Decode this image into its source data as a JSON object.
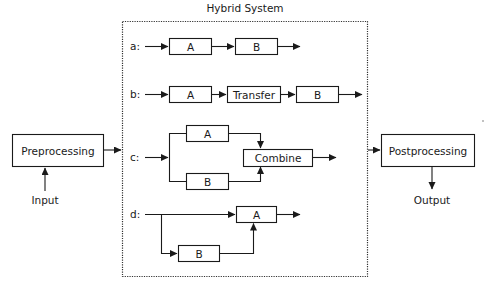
{
  "title": "Hybrid System",
  "preprocessing": {
    "label": "Preprocessing",
    "input_label": "Input"
  },
  "postprocessing": {
    "label": "Postprocessing",
    "output_label": "Output"
  },
  "rows": {
    "a": {
      "label": "a:",
      "boxes": [
        "A",
        "B"
      ]
    },
    "b": {
      "label": "b:",
      "boxes": [
        "A",
        "Transfer",
        "B"
      ]
    },
    "c": {
      "label": "c:",
      "boxes": [
        "A",
        "B",
        "Combine"
      ]
    },
    "d": {
      "label": "d:",
      "boxes": [
        "A",
        "B"
      ]
    }
  },
  "colors": {
    "stroke": "#1a1a1a",
    "background": "#ffffff"
  }
}
